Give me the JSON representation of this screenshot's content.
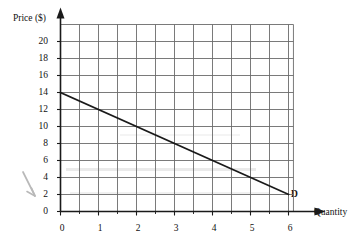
{
  "chart_data": {
    "type": "line",
    "title": "",
    "xlabel": "Quantity",
    "ylabel": "Price ($)",
    "xlim": [
      0,
      6.5
    ],
    "ylim": [
      0,
      22
    ],
    "xticks": [
      0,
      1,
      2,
      3,
      4,
      5,
      6
    ],
    "yticks": [
      0,
      2,
      4,
      6,
      8,
      10,
      12,
      14,
      16,
      18,
      20
    ],
    "xtick_labels": [
      "0",
      "1",
      "2",
      "3",
      "4",
      "5",
      "6"
    ],
    "ytick_labels": [
      "0",
      "2",
      "4",
      "6",
      "8",
      "10",
      "12",
      "14",
      "16",
      "18",
      "20"
    ],
    "grid": true,
    "grid_x_step": 0.5,
    "grid_y_step": 2,
    "legend": "none",
    "series": [
      {
        "name": "D",
        "label": "D",
        "type": "line",
        "color": "#1a1a1a",
        "x": [
          0,
          1,
          2,
          3,
          4,
          5,
          6
        ],
        "values": [
          14,
          12,
          10,
          8,
          6,
          4,
          2
        ],
        "endpoints": [
          [
            0,
            14
          ],
          [
            6,
            2
          ]
        ],
        "slope": -2,
        "intercept": 14
      }
    ],
    "annotations": [
      {
        "text": "D",
        "x": 6.15,
        "y": 2.2,
        "name": "demand-curve-label"
      },
      {
        "text": "",
        "x": 0.0,
        "y": 4.5,
        "name": "hand-drawn-arrow",
        "style": "faint gray pencil arrow pointing down-right, left of y-axis"
      }
    ]
  },
  "axes": {
    "y_axis_label": "Price ($)",
    "x_axis_label": "Quantity",
    "y_arrow": true,
    "x_arrow": true
  },
  "colors": {
    "curve": "#1a1a1a",
    "grid": "#6b6b6b",
    "axis": "#1a1a1a",
    "text": "#111111",
    "smudge": "#d9d9d9",
    "background": "#ffffff"
  }
}
